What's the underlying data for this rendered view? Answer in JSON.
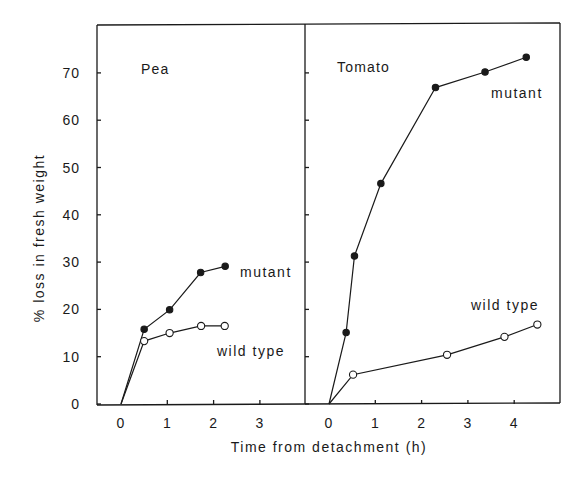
{
  "chart_data": {
    "type": "line",
    "ylabel": "% loss in fresh weight",
    "xlabel": "Time from detachment (h)",
    "ylim": [
      0,
      79
    ],
    "yticks": [
      0,
      10,
      20,
      30,
      40,
      50,
      60,
      70
    ],
    "grid": false,
    "panels": [
      {
        "title": "Pea",
        "xlim": [
          -0.5,
          4.0
        ],
        "xticks": [
          0,
          1,
          2,
          3
        ],
        "series": [
          {
            "name": "mutant",
            "marker": "filled-circle",
            "x": [
              0,
              0.5,
              1.05,
              1.72,
              2.25
            ],
            "y": [
              0,
              15.8,
              19.9,
              27.8,
              29.1
            ]
          },
          {
            "name": "wild type",
            "marker": "open-circle",
            "x": [
              0,
              0.5,
              1.05,
              1.73,
              2.24
            ],
            "y": [
              0,
              13.3,
              15.0,
              16.5,
              16.5
            ]
          }
        ]
      },
      {
        "title": "Tomato",
        "xlim": [
          -0.5,
          5.0
        ],
        "xticks": [
          0,
          1,
          2,
          3,
          4
        ],
        "series": [
          {
            "name": "mutant",
            "marker": "filled-circle",
            "x": [
              0,
              0.37,
              0.55,
              1.12,
              2.3,
              3.37,
              4.26
            ],
            "y": [
              0,
              15.1,
              31.3,
              46.6,
              66.9,
              70.2,
              73.3
            ]
          },
          {
            "name": "wild type",
            "marker": "open-circle",
            "x": [
              0,
              0.52,
              2.55,
              3.79,
              4.5
            ],
            "y": [
              0,
              6.2,
              10.4,
              14.2,
              16.8
            ]
          }
        ]
      }
    ]
  },
  "labels": {
    "pea_title": "Pea",
    "tomato_title": "Tomato",
    "pea_mutant": "mutant",
    "pea_wild": "wild type",
    "tomato_mutant": "mutant",
    "tomato_wild": "wild type",
    "ylabel": "% loss in fresh weight",
    "xlabel": "Time from detachment (h)"
  }
}
